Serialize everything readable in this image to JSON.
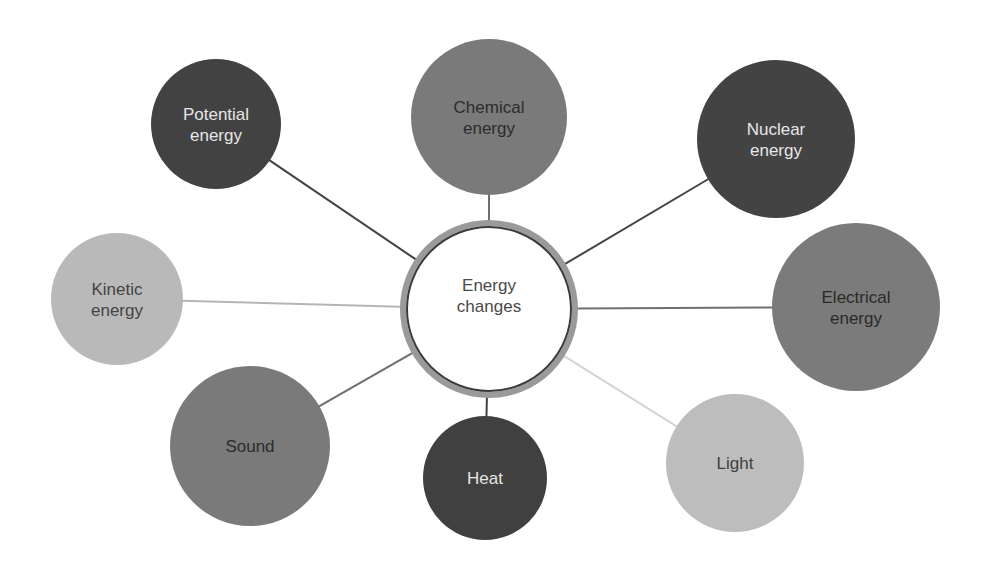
{
  "diagram": {
    "center": {
      "label_lines": [
        "Energy",
        "changes"
      ],
      "cx": 489,
      "cy": 309,
      "r": 86,
      "fill": "#ffffff",
      "ring_color": "#9a9a9a",
      "inner_border_color": "#3a3a3a",
      "text_color": "#4a4a4a"
    },
    "nodes": [
      {
        "id": "potential",
        "label_lines": [
          "Potential",
          "energy"
        ],
        "cx": 216,
        "cy": 124,
        "r": 65,
        "fill": "#424242",
        "text_color": "#e6e6e6",
        "line_color": "#424242"
      },
      {
        "id": "chemical",
        "label_lines": [
          "Chemical",
          "energy"
        ],
        "cx": 489,
        "cy": 117,
        "r": 78,
        "fill": "#7a7a7a",
        "text_color": "#2c2c2c",
        "line_color": "#6e6e6e"
      },
      {
        "id": "nuclear",
        "label_lines": [
          "Nuclear",
          "energy"
        ],
        "cx": 776,
        "cy": 139,
        "r": 79,
        "fill": "#434343",
        "text_color": "#e6e6e6",
        "line_color": "#434343"
      },
      {
        "id": "electrical",
        "label_lines": [
          "Electrical",
          "energy"
        ],
        "cx": 856,
        "cy": 307,
        "r": 84,
        "fill": "#7b7b7b",
        "text_color": "#2a2a2a",
        "line_color": "#707070"
      },
      {
        "id": "kinetic",
        "label_lines": [
          "Kinetic",
          "energy"
        ],
        "cx": 117,
        "cy": 299,
        "r": 66,
        "fill": "#b9b9b9",
        "text_color": "#444444",
        "line_color": "#b5b5b5"
      },
      {
        "id": "sound",
        "label_lines": [
          "Sound"
        ],
        "cx": 250,
        "cy": 446,
        "r": 80,
        "fill": "#7a7a7a",
        "text_color": "#2c2c2c",
        "line_color": "#6e6e6e"
      },
      {
        "id": "heat",
        "label_lines": [
          "Heat"
        ],
        "cx": 485,
        "cy": 478,
        "r": 62,
        "fill": "#404040",
        "text_color": "#e6e6e6",
        "line_color": "#404040"
      },
      {
        "id": "light",
        "label_lines": [
          "Light"
        ],
        "cx": 735,
        "cy": 463,
        "r": 69,
        "fill": "#bdbdbd",
        "text_color": "#404040",
        "line_color": "#d4d4d4"
      }
    ]
  }
}
